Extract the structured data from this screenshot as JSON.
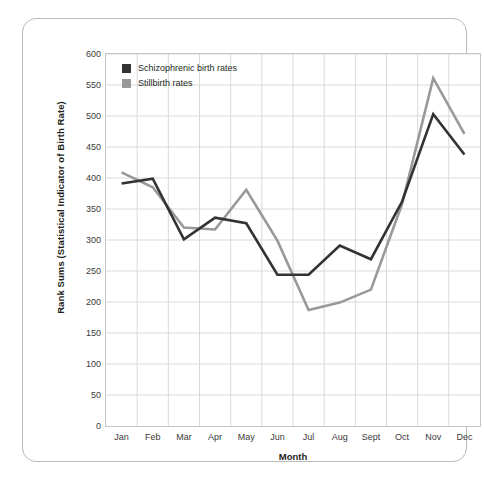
{
  "chart_data": {
    "type": "line",
    "title": "",
    "xlabel": "Month",
    "ylabel": "Rank Sums (Statistical Indicator of Birth Rate)",
    "categories": [
      "Jan",
      "Feb",
      "Mar",
      "Apr",
      "May",
      "Jun",
      "Jul",
      "Aug",
      "Sept",
      "Oct",
      "Nov",
      "Dec"
    ],
    "ylim": [
      0,
      600
    ],
    "ytick_step": 50,
    "yticks": [
      0,
      50,
      100,
      150,
      200,
      250,
      300,
      350,
      400,
      450,
      500,
      550,
      600
    ],
    "grid": true,
    "legend_position": "top-left",
    "series": [
      {
        "name": "Schizophrenic birth rates",
        "color": "#333333",
        "values": [
          391,
          399,
          301,
          336,
          327,
          244,
          244,
          291,
          269,
          362,
          503,
          438
        ]
      },
      {
        "name": "Stillbirth rates",
        "color": "#999999",
        "values": [
          409,
          385,
          320,
          317,
          381,
          299,
          187,
          199,
          220,
          358,
          561,
          471
        ]
      }
    ]
  },
  "legend": {
    "items": [
      {
        "label": "Schizophrenic birth rates",
        "swatch": "#333333"
      },
      {
        "label": "Stillbirth rates",
        "swatch": "#999999"
      }
    ]
  },
  "colors": {
    "schizophrenic": "#333333",
    "stillbirth": "#999999",
    "grid": "#d9d9d9",
    "axis": "#c6c6c6",
    "frame": "#b9b9b9",
    "text": "#231f20"
  }
}
